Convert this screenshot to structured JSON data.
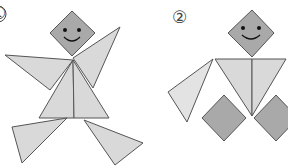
{
  "figures": [
    {
      "id": 1,
      "label": "①",
      "label_pos": {
        "x": -9,
        "y": 5
      },
      "description": "Tangram figure of a dancing person",
      "pieces": [
        {
          "name": "head-square",
          "shape": "square",
          "color": "#a9a9a9",
          "points": "72,11 95,33 72,56 50,33",
          "face": true
        },
        {
          "name": "right-arm-triangle",
          "shape": "triangle",
          "color": "#d9d9d9",
          "points": "73,58 120,27 93,88"
        },
        {
          "name": "left-arm-triangle",
          "shape": "triangle",
          "color": "#d9d9d9",
          "points": "5,55 73,60 50,90"
        },
        {
          "name": "body-left-triangle",
          "shape": "triangle",
          "color": "#d9d9d9",
          "points": "73,60 39,118 74,118"
        },
        {
          "name": "body-right-triangle",
          "shape": "triangle",
          "color": "#d9d9d9",
          "points": "73,60 74,118 109,118"
        },
        {
          "name": "left-leg-triangle",
          "shape": "triangle",
          "color": "#d9d9d9",
          "points": "12,127 67,118 22,163"
        },
        {
          "name": "right-leg-triangle",
          "shape": "triangle",
          "color": "#d9d9d9",
          "points": "84,120 143,143 115,165"
        }
      ],
      "face": {
        "eyes": [
          [
            65,
            30
          ],
          [
            79,
            30
          ]
        ],
        "smile": "M64,37 Q72,45 80,37"
      }
    },
    {
      "id": 2,
      "label": "②",
      "label_pos": {
        "x": 172,
        "y": 9
      },
      "description": "Tangram figure of a person with square feet",
      "pieces": [
        {
          "name": "head-square",
          "shape": "square",
          "color": "#a9a9a9",
          "points": "252,10 274,33 252,57 228,33",
          "face": true
        },
        {
          "name": "body-left-triangle",
          "shape": "triangle",
          "color": "#d9d9d9",
          "points": "215,59 252,59 252,116"
        },
        {
          "name": "body-right-triangle",
          "shape": "triangle",
          "color": "#d9d9d9",
          "points": "252,59 286,59 252,116"
        },
        {
          "name": "left-arm-triangle",
          "shape": "triangle",
          "color": "#e3e3e3",
          "points": "213,59 168,92 187,122"
        },
        {
          "name": "left-foot-square",
          "shape": "square",
          "color": "#a9a9a9",
          "points": "224,95 246,118 224,141 202,118"
        },
        {
          "name": "right-foot-square",
          "shape": "square",
          "color": "#a9a9a9",
          "points": "276,95 298,118 276,141 254,118"
        }
      ],
      "face": {
        "eyes": [
          [
            243,
            28
          ],
          [
            259,
            28
          ]
        ],
        "smile": "M242,35 Q251,43 260,35"
      }
    }
  ],
  "colors": {
    "stroke": "#555555",
    "dark_piece": "#a9a9a9",
    "light_piece": "#d9d9d9",
    "background": "#ffffff"
  }
}
